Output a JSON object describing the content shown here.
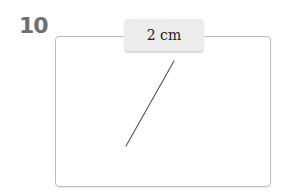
{
  "problem": {
    "number": "10",
    "length_label": "2 cm",
    "segment": {
      "x1": 174,
      "y1": 61,
      "x2": 126,
      "y2": 146,
      "color": "#555555"
    }
  }
}
